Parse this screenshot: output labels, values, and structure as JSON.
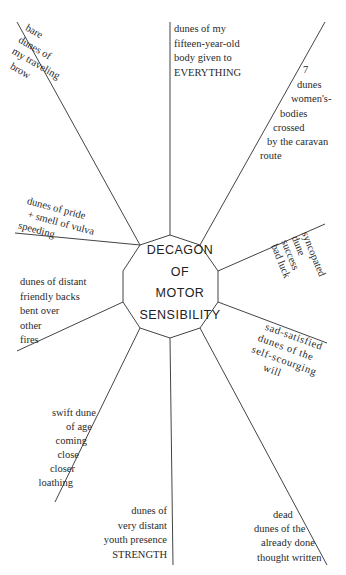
{
  "title": {
    "lines": [
      "DECAGON",
      "OF",
      "MOTOR",
      "SENSIBILITY"
    ]
  },
  "colors": {
    "ink": "#2a2a2a",
    "line": "#444444",
    "background": "#ffffff"
  },
  "rays": [
    {
      "id": "top-left",
      "lines": [
        "bare",
        "dunes of",
        "my traveling",
        "brow"
      ]
    },
    {
      "id": "top",
      "lines": [
        "dunes of my",
        "fifteen-year-old",
        "body given to",
        "EVERYTHING"
      ]
    },
    {
      "id": "top-right",
      "lines": [
        "7",
        "dunes",
        "women's-",
        "bodies",
        "crossed",
        "by the caravan",
        "route"
      ]
    },
    {
      "id": "right-upper",
      "lines": [
        "syncopated",
        "dune",
        "success",
        "bad luck"
      ]
    },
    {
      "id": "right-lower",
      "lines": [
        "sad-satisfied",
        "dunes of the",
        "self-scourging",
        "will"
      ]
    },
    {
      "id": "bottom-right",
      "lines": [
        "dead",
        "dunes of the",
        "already done",
        "thought written"
      ]
    },
    {
      "id": "bottom",
      "lines": [
        "dunes of",
        "very distant",
        "youth presence",
        "STRENGTH"
      ]
    },
    {
      "id": "bottom-left",
      "lines": [
        "swift dune",
        "of age",
        "coming",
        "close",
        "closer",
        "loathing"
      ]
    },
    {
      "id": "left-lower",
      "lines": [
        "dunes of distant",
        "friendly backs",
        "bent over",
        "other",
        "fires"
      ]
    },
    {
      "id": "left-upper",
      "lines": [
        "dunes of pride",
        "+ smell of vulva",
        "speeding"
      ]
    }
  ]
}
